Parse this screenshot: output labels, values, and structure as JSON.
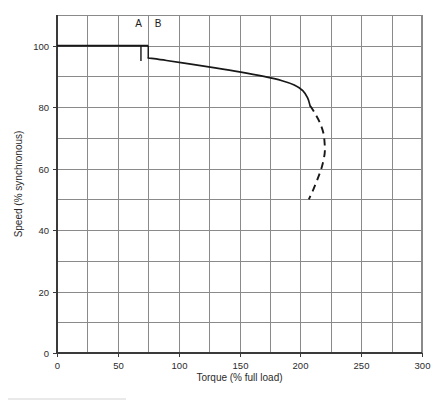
{
  "figure": {
    "background_color": "#ffffff",
    "ink_color": "#181818",
    "grid_color": "#8a8a8a"
  },
  "annotations": {
    "label_a": "A",
    "label_b": "B"
  },
  "chart_data": {
    "type": "line",
    "title": "",
    "xlabel": "Torque (% full load)",
    "ylabel": "Speed (% synchronous)",
    "xlim": [
      0,
      300
    ],
    "ylim": [
      0,
      110
    ],
    "grid": true,
    "legend_position": "none",
    "x_tick_labels": [
      "0",
      "50",
      "100",
      "150",
      "200",
      "250",
      "300"
    ],
    "x_tick_values": [
      0,
      50,
      100,
      150,
      200,
      250,
      300
    ],
    "x_gridline_step": 25,
    "y_tick_labels": [
      "0",
      "20",
      "40",
      "60",
      "80",
      "100"
    ],
    "y_tick_values": [
      0,
      20,
      40,
      60,
      80,
      100
    ],
    "y_gridline_step": 10,
    "series": [
      {
        "name": "Synchronous speed line",
        "style": "solid-heavy",
        "points": [
          {
            "x": 0,
            "y": 100
          },
          {
            "x": 75,
            "y": 100
          }
        ]
      },
      {
        "name": "Speed-torque characteristic (stable region)",
        "style": "solid",
        "points": [
          {
            "x": 75,
            "y": 96
          },
          {
            "x": 90,
            "y": 95.2
          },
          {
            "x": 110,
            "y": 94.0
          },
          {
            "x": 130,
            "y": 92.8
          },
          {
            "x": 150,
            "y": 91.5
          },
          {
            "x": 170,
            "y": 90.0
          },
          {
            "x": 185,
            "y": 88.6
          },
          {
            "x": 195,
            "y": 87.2
          },
          {
            "x": 202,
            "y": 85.4
          },
          {
            "x": 206,
            "y": 83.0
          },
          {
            "x": 208,
            "y": 80.5
          }
        ]
      },
      {
        "name": "Speed-torque characteristic (unstable region)",
        "style": "dashed",
        "points": [
          {
            "x": 208,
            "y": 80.5
          },
          {
            "x": 212,
            "y": 78.0
          },
          {
            "x": 216,
            "y": 75.0
          },
          {
            "x": 219,
            "y": 71.5
          },
          {
            "x": 220,
            "y": 68.0
          },
          {
            "x": 220,
            "y": 65.0
          },
          {
            "x": 218,
            "y": 61.0
          },
          {
            "x": 215,
            "y": 57.5
          },
          {
            "x": 211,
            "y": 53.5
          },
          {
            "x": 207,
            "y": 50.0
          }
        ]
      }
    ],
    "markers": [
      {
        "name": "point-a-drop",
        "label": "A",
        "x": 69,
        "y_from": 100,
        "y_to": 95,
        "label_x": 67,
        "label_y": 106
      },
      {
        "name": "point-b-drop",
        "label": "B",
        "x": 75,
        "y_from": 100,
        "y_to": 96,
        "label_x": 83,
        "label_y": 106
      }
    ],
    "notes": {
      "pullup_torque": 208,
      "breakdown_torque": 220,
      "breakdown_speed": 67,
      "locked_rotor_endpoint_torque": 207,
      "locked_rotor_endpoint_speed": 50,
      "no_load_speed": 100,
      "full_load_speed": 96
    }
  }
}
